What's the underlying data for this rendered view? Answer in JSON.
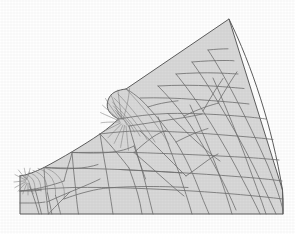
{
  "figure": {
    "type": "fem-mesh",
    "domain_shape": "notched circular sector",
    "background_color": "#ffffff",
    "element_fill_color": "#d9d9d9",
    "element_edge_color": "#6f6f6f",
    "boundary_color": "#5d5d5d",
    "canvas": {
      "width": 295,
      "height": 234
    },
    "element_type": "quadrilateral",
    "refinement_zones": [
      {
        "name": "notch-root-fan",
        "center_x": 125,
        "center_y": 118,
        "rings": 8,
        "spokes": 14
      },
      {
        "name": "left-corner-fan",
        "center_x": 28,
        "center_y": 180,
        "rings": 7,
        "spokes": 12
      }
    ],
    "boundary_points": [
      [
        20,
        176
      ],
      [
        20,
        214
      ],
      [
        283,
        214
      ],
      [
        283,
        190
      ],
      [
        229,
        19
      ],
      [
        126,
        89
      ],
      [
        112,
        95
      ],
      [
        108,
        110
      ],
      [
        118,
        119
      ],
      [
        104,
        133
      ],
      [
        72,
        152
      ],
      [
        44,
        167
      ]
    ],
    "notch": {
      "name": "concave-fillet-notch",
      "apex_x": 108,
      "apex_y": 112,
      "mouth_top_x": 126,
      "mouth_top_y": 89
    },
    "labels": {
      "caption": ""
    }
  }
}
